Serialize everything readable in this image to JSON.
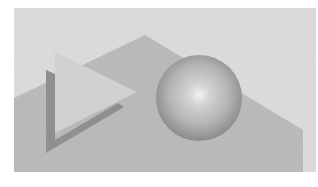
{
  "image": {
    "description": "Grayscale illustration of simple geometric shapes: a pale triangle with a dark shadow edge and a shaded sphere in front of a gray angular backdrop",
    "colors": {
      "page": "#ffffff",
      "background": "#dcdcdc",
      "backdrop": "#b9b9b9",
      "triangle": "#d2d2d2",
      "shadow": "#8c8c8c",
      "sphere_highlight": "#f4f4f4",
      "sphere_mid": "#b4b4b4",
      "sphere_edge": "#7e7e7e"
    },
    "frame": {
      "x": 14,
      "y": 8,
      "width": 302,
      "height": 164
    },
    "backdrop_points": "14,98 145,35 303,130 303,172 14,172",
    "triangle_points": "55,52 137,92 55,133",
    "shadow_points": "46,70 55,74 55,140 118,103 124,107 46,153",
    "sphere": {
      "cx": 199,
      "cy": 98,
      "r": 43,
      "highlight_x": "50%",
      "highlight_y": "46%"
    }
  }
}
